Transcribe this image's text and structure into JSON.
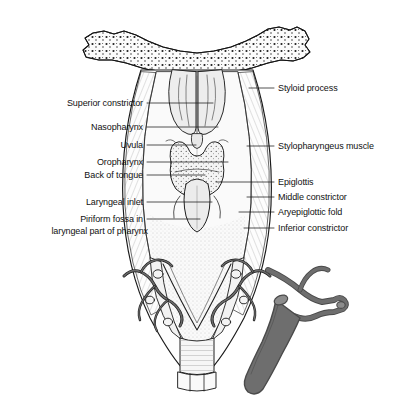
{
  "figure": {
    "background_color": "#ffffff",
    "line_color": "#1a1a1a",
    "vessel_fill_color": "#6a6a6a",
    "bone_stipple_color": "#1a1a1a",
    "mucosa_fill_color": "#f2f2f2",
    "width": 395,
    "height": 411
  },
  "labels_left": [
    {
      "id": "superior-constrictor",
      "text": "Superior constrictor",
      "x": 143,
      "y": 100,
      "leader_to_x": 213,
      "leader_to_y": 106
    },
    {
      "id": "nasopharynx",
      "text": "Nasopharynx",
      "x": 143,
      "y": 124,
      "leader_to_x": 218,
      "leader_to_y": 128
    },
    {
      "id": "uvula",
      "text": "Uvula",
      "x": 143,
      "y": 143,
      "leader_to_x": 196,
      "leader_to_y": 146
    },
    {
      "id": "oropharynx",
      "text": "Oropharynx",
      "x": 143,
      "y": 159,
      "leader_to_x": 228,
      "leader_to_y": 162
    },
    {
      "id": "back-of-tongue",
      "text": "Back of tongue",
      "x": 143,
      "y": 172,
      "leader_to_x": 205,
      "leader_to_y": 175
    },
    {
      "id": "laryngeal-inlet",
      "text": "Laryngeal inlet",
      "x": 143,
      "y": 199,
      "leader_to_x": 212,
      "leader_to_y": 202
    },
    {
      "id": "piriform-fossa",
      "text": "Piriform fossa in\nlaryngeal part of pharynx",
      "line1": "Piriform fossa in",
      "line2": "laryngeal part of pharynx",
      "x": 143,
      "y": 216,
      "leader_to_x": 200,
      "leader_to_y": 219
    }
  ],
  "labels_right": [
    {
      "id": "styloid-process",
      "text": "Styloid process",
      "x": 278,
      "y": 85,
      "leader_to_x": 249,
      "leader_to_y": 88
    },
    {
      "id": "stylopharyngeus-muscle",
      "text": "Stylopharyngeus muscle",
      "x": 278,
      "y": 142,
      "leader_to_x": 249,
      "leader_to_y": 146
    },
    {
      "id": "epiglottis",
      "text": "Epiglottis",
      "x": 278,
      "y": 178,
      "leader_to_x": 216,
      "leader_to_y": 182
    },
    {
      "id": "middle-constrictor",
      "text": "Middle constrictor",
      "x": 278,
      "y": 193,
      "leader_to_x": 247,
      "leader_to_y": 197
    },
    {
      "id": "aryepiglottic-fold",
      "text": "Aryepiglottic fold",
      "x": 278,
      "y": 208,
      "leader_to_x": 239,
      "leader_to_y": 212
    },
    {
      "id": "inferior-constrictor",
      "text": "Inferior constrictor",
      "x": 278,
      "y": 224,
      "leader_to_x": 244,
      "leader_to_y": 228
    }
  ],
  "structures": [
    {
      "id": "skull-base-bone",
      "label": "skull base bone",
      "style": "stippled bone"
    },
    {
      "id": "nasal-choanae",
      "label": "posterior nasal apertures"
    },
    {
      "id": "nasal-septum",
      "label": "nasal septum"
    },
    {
      "id": "uvula-body",
      "label": "uvula"
    },
    {
      "id": "tongue-base",
      "label": "back of tongue"
    },
    {
      "id": "epiglottis-body",
      "label": "epiglottis"
    },
    {
      "id": "pharynx-wall",
      "label": "pharyngeal wall"
    },
    {
      "id": "thyroid-cartilage",
      "label": "thyroid cartilage"
    },
    {
      "id": "esophagus",
      "label": "esophagus"
    },
    {
      "id": "vessel-branches-left",
      "label": "left neurovascular branches"
    },
    {
      "id": "vessel-branches-right",
      "label": "right neurovascular branches"
    },
    {
      "id": "dark-vessel-trunk",
      "label": "vascular trunk"
    }
  ]
}
